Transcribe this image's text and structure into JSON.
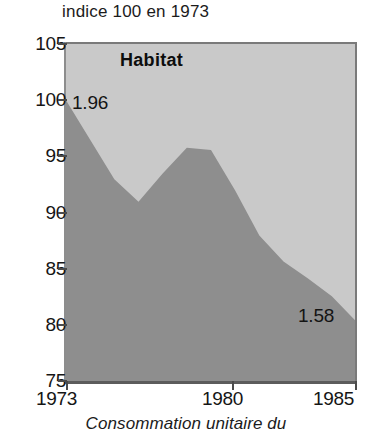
{
  "axis_note": "indice 100 en 1973",
  "caption": "Consommation unitaire du",
  "series_label": "Habitat",
  "labels": {
    "start_value": "1.96",
    "end_value": "1.58"
  },
  "colors": {
    "area_fill": "#8e8e8e",
    "plot_background": "#c9c9c9",
    "axis": "#4a4a4a",
    "text": "#151515"
  },
  "y_ticks": [
    "105",
    "100",
    "95",
    "90",
    "85",
    "80",
    "75"
  ],
  "x_ticks": [
    "1973",
    "1980",
    "1985"
  ],
  "chart_data": {
    "type": "area",
    "title": "Habitat",
    "subtitle": "indice 100 en 1973",
    "xlabel": "",
    "ylabel": "indice 100 en 1973",
    "xlim": [
      1973,
      1985
    ],
    "ylim": [
      75,
      105
    ],
    "grid": false,
    "legend": "none",
    "annotations": [
      {
        "text": "1.96",
        "x": 1973,
        "y": 100.0
      },
      {
        "text": "1.58",
        "x": 1985,
        "y": 80.4
      }
    ],
    "x": [
      1973,
      1974,
      1975,
      1976,
      1977,
      1978,
      1979,
      1980,
      1981,
      1982,
      1983,
      1984,
      1985
    ],
    "values": [
      100.0,
      96.5,
      93.0,
      91.0,
      93.5,
      95.8,
      95.6,
      92.0,
      88.0,
      85.7,
      84.2,
      82.6,
      80.4
    ],
    "categories": [
      "1973",
      "1974",
      "1975",
      "1976",
      "1977",
      "1978",
      "1979",
      "1980",
      "1981",
      "1982",
      "1983",
      "1984",
      "1985"
    ],
    "series": [
      {
        "name": "Habitat",
        "values": [
          100.0,
          96.5,
          93.0,
          91.0,
          93.5,
          95.8,
          95.6,
          92.0,
          88.0,
          85.7,
          84.2,
          82.6,
          80.4
        ]
      }
    ]
  }
}
